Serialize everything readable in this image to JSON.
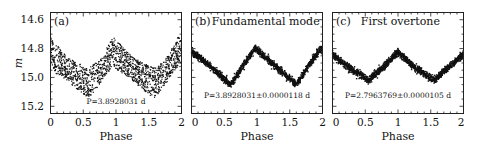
{
  "chart_data": [
    {
      "type": "scatter",
      "panel": "a",
      "title": "(a)",
      "annotation": "P=3.8928031 d",
      "xlabel": "Phase",
      "ylabel": "m",
      "xlim": [
        0,
        2
      ],
      "ylim": [
        15.25,
        14.55
      ],
      "y_inverted": true,
      "xticks": [
        "0",
        "0.5",
        "1",
        "1.5",
        "2"
      ],
      "yticks": [
        "14.6",
        "14.8",
        "15.0",
        "15.2"
      ],
      "grid": false,
      "description": "Broad scatter band: blend of fundamental and first overtone pulsations",
      "series": [
        {
          "name": "upper envelope",
          "x": [
            0,
            0.25,
            0.5,
            0.6,
            0.75,
            0.95,
            1.0,
            1.25,
            1.5,
            1.6,
            1.75,
            1.95,
            2.0
          ],
          "y": [
            14.72,
            14.86,
            14.92,
            14.93,
            14.88,
            14.72,
            14.74,
            14.86,
            14.92,
            14.93,
            14.88,
            14.72,
            14.74
          ]
        },
        {
          "name": "lower envelope",
          "x": [
            0,
            0.25,
            0.5,
            0.6,
            0.75,
            0.95,
            1.0,
            1.25,
            1.5,
            1.6,
            1.75,
            1.95,
            2.0
          ],
          "y": [
            14.95,
            15.02,
            15.12,
            15.14,
            15.05,
            14.92,
            14.94,
            15.02,
            15.12,
            15.14,
            15.05,
            14.92,
            14.94
          ]
        }
      ]
    },
    {
      "type": "scatter",
      "panel": "b",
      "title": "(b) Fundamental mode",
      "annotation": "P=3.8928031±0.0000118 d",
      "xlabel": "Phase",
      "xlim": [
        0,
        2
      ],
      "ylim": [
        15.25,
        14.55
      ],
      "y_inverted": true,
      "xticks": [
        "0",
        "0.5",
        "1",
        "1.5",
        "2"
      ],
      "grid": false,
      "series": [
        {
          "name": "fundamental",
          "x": [
            0,
            0.2,
            0.4,
            0.6,
            0.8,
            0.97,
            1.2,
            1.4,
            1.6,
            1.8,
            1.97,
            2.0
          ],
          "y": [
            14.82,
            14.89,
            14.97,
            15.05,
            14.91,
            14.8,
            14.89,
            14.97,
            15.05,
            14.91,
            14.8,
            14.81
          ]
        }
      ]
    },
    {
      "type": "scatter",
      "panel": "c",
      "title": "(c)  First overtone",
      "annotation": "P=2.7963769±0.0000105 d",
      "xlabel": "Phase",
      "xlim": [
        0,
        2
      ],
      "ylim": [
        15.25,
        14.55
      ],
      "y_inverted": true,
      "xticks": [
        "0",
        "0.5",
        "1",
        "1.5",
        "2"
      ],
      "grid": false,
      "series": [
        {
          "name": "first overtone",
          "x": [
            0,
            0.25,
            0.55,
            0.75,
            1.0,
            1.25,
            1.55,
            1.75,
            2.0
          ],
          "y": [
            14.84,
            14.93,
            15.02,
            14.94,
            14.82,
            14.93,
            15.02,
            14.94,
            14.84
          ]
        }
      ]
    }
  ],
  "labels": {
    "panel_a": "(a)",
    "panel_b": "(b)",
    "panel_b_title": "Fundamental mode",
    "panel_c": "(c)",
    "panel_c_title": "First overtone",
    "period_a": "P=3.8928031 d",
    "period_b": "P=3.8928031±0.0000118 d",
    "period_c": "P=2.7963769±0.0000105 d",
    "xlabel": "Phase",
    "ylabel": "m",
    "xticks": [
      "0",
      "0.5",
      "1",
      "1.5",
      "2"
    ],
    "yticks": [
      "14.6",
      "14.8",
      "15.0",
      "15.2"
    ]
  }
}
